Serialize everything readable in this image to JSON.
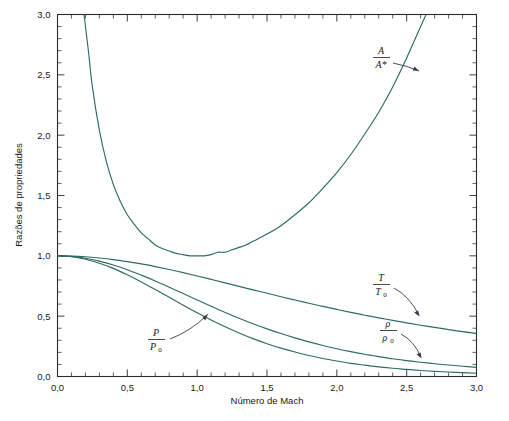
{
  "chart_data": {
    "type": "line",
    "title": "",
    "xlabel": "Número de Mach",
    "ylabel": "Razões de propriedades",
    "xlim": [
      0.0,
      3.0
    ],
    "ylim": [
      0.0,
      3.0
    ],
    "grid": false,
    "legend_position": "inline-annotations",
    "x_tick_labels": [
      "0,0",
      "0,5",
      "1,0",
      "1,5",
      "2,0",
      "2,5",
      "3,0"
    ],
    "x_tick_values": [
      0.0,
      0.5,
      1.0,
      1.5,
      2.0,
      2.5,
      3.0
    ],
    "y_tick_labels": [
      "0,0",
      "0,5",
      "1,0",
      "1,5",
      "2,0",
      "2,5",
      "3,0"
    ],
    "y_tick_values": [
      0.0,
      0.5,
      1.0,
      1.5,
      2.0,
      2.5,
      3.0
    ],
    "minor_tick_step": 0.1,
    "curve_color": "#2e6b63",
    "series": [
      {
        "name": "A/A*",
        "label_numerator": "A",
        "label_denominator": "A*",
        "x": [
          0.19,
          0.22,
          0.25,
          0.3,
          0.35,
          0.4,
          0.45,
          0.5,
          0.55,
          0.6,
          0.65,
          0.7,
          0.75,
          0.8,
          0.85,
          0.9,
          0.95,
          1.0,
          1.05,
          1.1,
          1.15,
          1.2,
          1.25,
          1.3,
          1.35,
          1.4,
          1.5,
          1.6,
          1.7,
          1.8,
          1.9,
          2.0,
          2.1,
          2.2,
          2.3,
          2.4,
          2.5,
          2.6,
          2.64
        ],
        "values": [
          3.0,
          2.71,
          2.4,
          2.04,
          1.78,
          1.59,
          1.45,
          1.34,
          1.26,
          1.19,
          1.14,
          1.09,
          1.06,
          1.04,
          1.02,
          1.01,
          1.0,
          1.0,
          1.0,
          1.01,
          1.03,
          1.03,
          1.05,
          1.07,
          1.09,
          1.12,
          1.18,
          1.25,
          1.34,
          1.44,
          1.56,
          1.69,
          1.84,
          2.01,
          2.19,
          2.4,
          2.64,
          2.9,
          3.0
        ]
      },
      {
        "name": "T/T0",
        "label_numerator": "T",
        "label_denominator": "T₀",
        "x": [
          0.0,
          0.1,
          0.2,
          0.3,
          0.4,
          0.5,
          0.6,
          0.7,
          0.8,
          0.9,
          1.0,
          1.1,
          1.2,
          1.3,
          1.4,
          1.5,
          1.6,
          1.7,
          1.8,
          1.9,
          2.0,
          2.1,
          2.2,
          2.3,
          2.4,
          2.5,
          2.6,
          2.7,
          2.8,
          2.9,
          3.0
        ],
        "values": [
          1.0,
          0.998,
          0.992,
          0.982,
          0.969,
          0.952,
          0.933,
          0.911,
          0.887,
          0.861,
          0.833,
          0.805,
          0.776,
          0.747,
          0.718,
          0.69,
          0.661,
          0.634,
          0.607,
          0.581,
          0.556,
          0.531,
          0.508,
          0.486,
          0.465,
          0.444,
          0.425,
          0.407,
          0.389,
          0.372,
          0.357
        ]
      },
      {
        "name": "rho/rho0",
        "label_numerator": "ρ",
        "label_denominator": "ρ₀",
        "x": [
          0.0,
          0.1,
          0.2,
          0.3,
          0.4,
          0.5,
          0.6,
          0.7,
          0.8,
          0.9,
          1.0,
          1.1,
          1.2,
          1.3,
          1.4,
          1.5,
          1.6,
          1.7,
          1.8,
          1.9,
          2.0,
          2.1,
          2.2,
          2.3,
          2.4,
          2.5,
          2.6,
          2.7,
          2.8,
          2.9,
          3.0
        ],
        "values": [
          1.0,
          0.995,
          0.98,
          0.956,
          0.924,
          0.885,
          0.84,
          0.792,
          0.74,
          0.687,
          0.634,
          0.582,
          0.531,
          0.483,
          0.437,
          0.395,
          0.356,
          0.32,
          0.287,
          0.257,
          0.23,
          0.206,
          0.184,
          0.165,
          0.147,
          0.132,
          0.118,
          0.106,
          0.095,
          0.085,
          0.076
        ]
      },
      {
        "name": "P/P0",
        "label_numerator": "P",
        "label_denominator": "P₀",
        "x": [
          0.0,
          0.1,
          0.2,
          0.3,
          0.4,
          0.5,
          0.6,
          0.7,
          0.8,
          0.9,
          1.0,
          1.1,
          1.2,
          1.3,
          1.4,
          1.5,
          1.6,
          1.7,
          1.8,
          1.9,
          2.0,
          2.1,
          2.2,
          2.3,
          2.4,
          2.5,
          2.6,
          2.7,
          2.8,
          2.9,
          3.0
        ],
        "values": [
          1.0,
          0.993,
          0.972,
          0.939,
          0.896,
          0.843,
          0.784,
          0.721,
          0.656,
          0.591,
          0.528,
          0.468,
          0.412,
          0.361,
          0.314,
          0.272,
          0.235,
          0.203,
          0.174,
          0.149,
          0.128,
          0.109,
          0.094,
          0.08,
          0.068,
          0.059,
          0.05,
          0.043,
          0.037,
          0.032,
          0.027
        ]
      }
    ],
    "annotations": [
      {
        "name": "A/A*",
        "label_x": 2.02,
        "label_y": 2.72
      },
      {
        "name": "T/T0",
        "label_x": 1.99,
        "label_y": 0.76
      },
      {
        "name": "rho/rho0",
        "label_x": 2.07,
        "label_y": 0.4
      },
      {
        "name": "P/P0",
        "label_x": 0.56,
        "label_y": 0.3
      }
    ]
  },
  "axes": {
    "x_title": "Número de Mach",
    "y_title": "Razões de propriedades",
    "x_ticks": [
      "0,0",
      "0,5",
      "1,0",
      "1,5",
      "2,0",
      "2,5",
      "3,0"
    ],
    "y_ticks": [
      "0,0",
      "0,5",
      "1,0",
      "1,5",
      "2,0",
      "2,5",
      "3,0"
    ]
  },
  "labels": {
    "area_num": "A",
    "area_den": "A*",
    "temp_num": "T",
    "temp_den": "T",
    "temp_den_sub": "0",
    "rho_num": "ρ",
    "rho_den": "ρ",
    "rho_den_sub": "0",
    "pressure_num": "P",
    "pressure_den": "P",
    "pressure_den_sub": "0"
  }
}
